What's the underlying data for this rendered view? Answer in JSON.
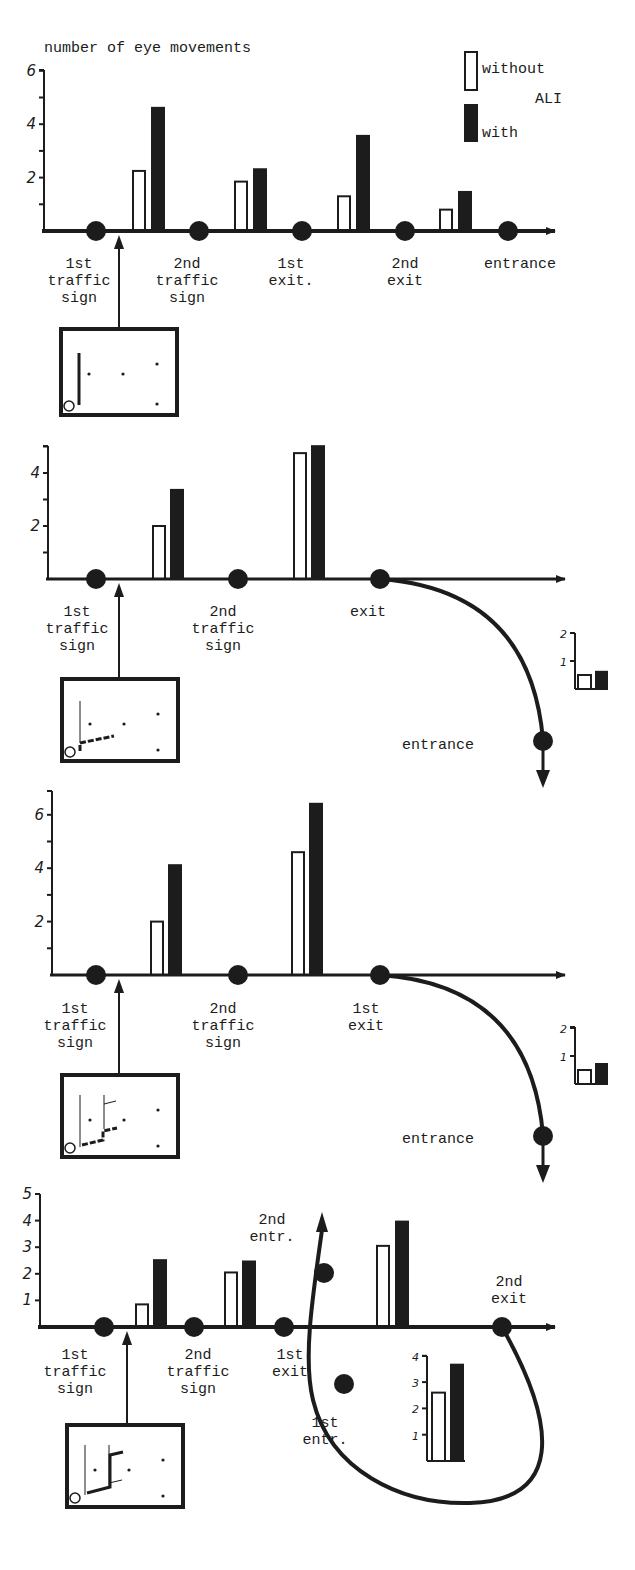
{
  "figure": {
    "y_axis_title": "number of eye movements",
    "legend": {
      "without_label": "without",
      "ali_label": "ALI",
      "with_label": "with"
    },
    "colors": {
      "ink": "#1c1c1c",
      "paper": "#ffffff"
    }
  },
  "chart_data": [
    {
      "type": "bar",
      "panel": 1,
      "title": "number of eye movements",
      "ylabel": "number of eye movements",
      "ylim": [
        0,
        6
      ],
      "yticks": [
        2,
        4,
        6
      ],
      "minor_ticks": [
        1,
        3,
        5
      ],
      "road_points": [
        "1st traffic sign",
        "2nd traffic sign",
        "1st exit",
        "2nd exit",
        "entrance"
      ],
      "categories": [
        "1st traffic sign → 2nd traffic sign",
        "2nd traffic sign → 1st exit",
        "1st exit → 2nd exit",
        "2nd exit → entrance"
      ],
      "series": [
        {
          "name": "without ALI",
          "fill": "white",
          "values": [
            2.25,
            1.85,
            1.3,
            0.8
          ]
        },
        {
          "name": "with ALI",
          "fill": "black",
          "values": [
            4.65,
            2.35,
            3.6,
            1.5
          ]
        }
      ],
      "legend": [
        "without ALI",
        "with ALI"
      ],
      "legend_position": "top-right",
      "grid": false
    },
    {
      "type": "bar",
      "panel": 2,
      "ylim": [
        0,
        5
      ],
      "yticks": [
        2,
        4
      ],
      "minor_ticks": [
        1,
        3,
        5
      ],
      "road_points": [
        "1st traffic sign",
        "2nd traffic sign",
        "exit",
        "entrance"
      ],
      "categories": [
        "1st traffic sign → 2nd traffic sign",
        "2nd traffic sign → exit"
      ],
      "series": [
        {
          "name": "without ALI",
          "fill": "white",
          "values": [
            2.0,
            4.75
          ]
        },
        {
          "name": "with ALI",
          "fill": "black",
          "values": [
            3.4,
            5.05
          ]
        }
      ],
      "inset": {
        "label": "exit → entrance",
        "ylim": [
          0,
          2
        ],
        "yticks": [
          1,
          2
        ],
        "series": [
          {
            "name": "without ALI",
            "values": [
              0.5
            ]
          },
          {
            "name": "with ALI",
            "values": [
              0.65
            ]
          }
        ]
      },
      "grid": false
    },
    {
      "type": "bar",
      "panel": 3,
      "ylim": [
        0,
        7
      ],
      "yticks": [
        2,
        4,
        6
      ],
      "minor_ticks": [
        1,
        3,
        5,
        7
      ],
      "road_points": [
        "1st traffic sign",
        "2nd traffic sign",
        "1st exit",
        "entrance"
      ],
      "categories": [
        "1st traffic sign → 2nd traffic sign",
        "2nd traffic sign → 1st exit"
      ],
      "series": [
        {
          "name": "without ALI",
          "fill": "white",
          "values": [
            2.0,
            4.6
          ]
        },
        {
          "name": "with ALI",
          "fill": "black",
          "values": [
            4.15,
            6.45
          ]
        }
      ],
      "inset": {
        "label": "1st exit → entrance",
        "ylim": [
          0,
          2
        ],
        "yticks": [
          1,
          2
        ],
        "series": [
          {
            "name": "without ALI",
            "values": [
              0.5
            ]
          },
          {
            "name": "with ALI",
            "values": [
              0.75
            ]
          }
        ]
      },
      "grid": false
    },
    {
      "type": "bar",
      "panel": 4,
      "ylim": [
        0,
        5
      ],
      "yticks": [
        1,
        2,
        3,
        4,
        5
      ],
      "road_points": [
        "1st traffic sign",
        "2nd traffic sign",
        "1st exit",
        "2nd entr.",
        "1st entr.",
        "2nd exit"
      ],
      "categories": [
        "1st traffic sign → 2nd traffic sign",
        "2nd traffic sign → 1st exit",
        "1st exit → 2nd exit"
      ],
      "series": [
        {
          "name": "without ALI",
          "fill": "white",
          "values": [
            0.85,
            2.05,
            3.05
          ]
        },
        {
          "name": "with ALI",
          "fill": "black",
          "values": [
            2.55,
            2.5,
            4.0
          ]
        }
      ],
      "inset": {
        "label": "1st entr. → 2nd exit (loop)",
        "ylim": [
          0,
          4
        ],
        "yticks": [
          1,
          2,
          3,
          4
        ],
        "series": [
          {
            "name": "without ALI",
            "values": [
              2.6
            ]
          },
          {
            "name": "with ALI",
            "values": [
              3.7
            ]
          }
        ]
      },
      "grid": false
    }
  ],
  "panels": [
    {
      "labels": {
        "p1": [
          "1st",
          "traffic",
          "sign"
        ],
        "p2": [
          "2nd",
          "traffic",
          "sign"
        ],
        "p3": [
          "1st",
          "exit."
        ],
        "p4": [
          "2nd",
          "exit"
        ],
        "p5": [
          "entrance"
        ]
      }
    },
    {
      "labels": {
        "p1": [
          "1st",
          "traffic",
          "sign"
        ],
        "p2": [
          "2nd",
          "traffic",
          "sign"
        ],
        "p3": [
          "exit"
        ],
        "p4": [
          "entrance"
        ]
      }
    },
    {
      "labels": {
        "p1": [
          "1st",
          "traffic",
          "sign"
        ],
        "p2": [
          "2nd",
          "traffic",
          "sign"
        ],
        "p3": [
          "1st",
          "exit"
        ],
        "p4": [
          "entrance"
        ]
      }
    },
    {
      "labels": {
        "p1": [
          "1st",
          "traffic",
          "sign"
        ],
        "p2": [
          "2nd",
          "traffic",
          "sign"
        ],
        "p3": [
          "1st",
          "exit"
        ],
        "p4": [
          "2nd",
          "entr."
        ],
        "p5": [
          "1st",
          "entr."
        ],
        "p6": [
          "2nd",
          "exit"
        ]
      }
    }
  ]
}
